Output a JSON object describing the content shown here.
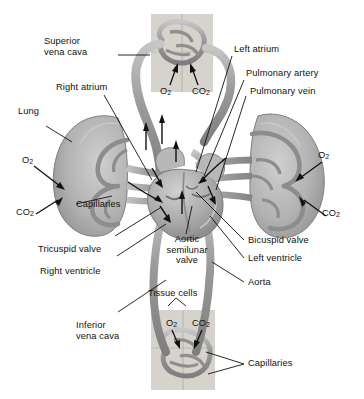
{
  "diagram": {
    "background_color": "#ffffff",
    "ink_color": "#111111",
    "vessel_gray_dark": "#8d8d8d",
    "vessel_gray_mid": "#a9a9a9",
    "vessel_gray_light": "#c8c8c8",
    "organ_gray": "#b4b4b4",
    "tissue_block_gray": "#cfcbc4"
  },
  "labels": {
    "superior_vena_cava": "Superior\nvena cava",
    "right_atrium": "Right atrium",
    "lung_left": "Lung",
    "capillaries_left": "Capillaries",
    "tricuspid_valve": "Tricuspid valve",
    "right_ventricle": "Right ventricle",
    "inferior_vena_cava": "Inferior\nvena cava",
    "left_atrium": "Left atrium",
    "pulmonary_artery": "Pulmonary artery",
    "pulmonary_vein": "Pulmonary vein",
    "bicuspid_valve": "Bicuspid valve",
    "left_ventricle": "Left ventricle",
    "aorta": "Aorta",
    "aortic_semilunar_valve": "Aortic\nsemilunar\nvalve",
    "tissue_cells": "Tissue cells",
    "capillaries_bottom": "Capillaries"
  },
  "gases": {
    "top_o2": "O",
    "top_o2_sub": "2",
    "top_co2": "CO",
    "top_co2_sub": "2",
    "left_o2": "O",
    "left_o2_sub": "2",
    "left_co2": "CO",
    "left_co2_sub": "2",
    "right_o2": "O",
    "right_o2_sub": "2",
    "right_co2": "CO",
    "right_co2_sub": "2",
    "bottom_o2": "O",
    "bottom_o2_sub": "2",
    "bottom_co2": "CO",
    "bottom_co2_sub": "2"
  }
}
